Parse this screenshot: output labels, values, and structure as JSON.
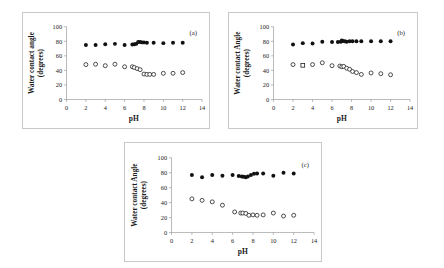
{
  "figure": {
    "background_color": "#ffffff",
    "panel_border_color": "#c9c9c9",
    "marker_filled_color": "#111111",
    "marker_open_color": "#ffffff"
  },
  "chart_data": [
    {
      "type": "scatter",
      "panel_label": "(a)",
      "title": "",
      "xlabel": "pH",
      "ylabel": "Water contact angle (degrees)",
      "ylabel_line1": "Water contact angle",
      "ylabel_line2": "(degrees)",
      "xlim": [
        0,
        14
      ],
      "ylim": [
        0,
        100
      ],
      "xticks": [
        0,
        2,
        4,
        6,
        8,
        10,
        12,
        14
      ],
      "yticks": [
        0,
        20,
        40,
        60,
        80,
        100
      ],
      "grid": false,
      "legend": "none",
      "series": [
        {
          "name": "filled-circles",
          "marker": "filled-circle",
          "x": [
            2.0,
            3.0,
            4.0,
            5.0,
            6.0,
            6.8,
            7.0,
            7.2,
            7.4,
            7.6,
            7.8,
            8.0,
            8.3,
            9.0,
            10.0,
            11.0,
            12.0
          ],
          "y": [
            75,
            75,
            76,
            76.5,
            75,
            75.5,
            76,
            76.5,
            79,
            79,
            78.5,
            78.5,
            78,
            78,
            77.5,
            78,
            78
          ]
        },
        {
          "name": "open-circles",
          "marker": "open-circle",
          "x": [
            2.0,
            3.0,
            4.0,
            5.0,
            6.0,
            6.8,
            7.0,
            7.3,
            7.6,
            8.0,
            8.3,
            8.6,
            9.0,
            10.0,
            11.0,
            12.0
          ],
          "y": [
            48,
            48.5,
            46.5,
            48.5,
            45,
            45,
            44,
            42.5,
            41,
            35,
            34.5,
            34.5,
            34.5,
            36,
            36,
            37
          ]
        }
      ]
    },
    {
      "type": "scatter",
      "panel_label": "(b)",
      "title": "",
      "xlabel": "pH",
      "ylabel": "Water contact Angle (degrees)",
      "ylabel_line1": "Water contact Angle",
      "ylabel_line2": "(degrees)",
      "xlim": [
        0,
        14
      ],
      "ylim": [
        0,
        100
      ],
      "xticks": [
        0,
        2,
        4,
        6,
        8,
        10,
        12,
        14
      ],
      "yticks": [
        0,
        20,
        40,
        60,
        80,
        100
      ],
      "grid": false,
      "legend": "none",
      "series": [
        {
          "name": "filled-circles",
          "marker": "filled-circle",
          "x": [
            2.0,
            3.0,
            4.0,
            5.0,
            6.0,
            6.6,
            6.9,
            7.0,
            7.1,
            7.3,
            7.5,
            7.8,
            8.1,
            8.5,
            9.0,
            10.0,
            11.0,
            12.0
          ],
          "y": [
            75.5,
            77.5,
            77,
            79.5,
            79,
            79,
            79.5,
            81,
            80.5,
            80,
            79.5,
            80,
            80,
            80,
            80,
            80,
            80,
            80
          ]
        },
        {
          "name": "open-circles",
          "marker": "open-circle",
          "x": [
            2.0,
            4.0,
            5.0,
            6.0,
            6.8,
            7.0,
            7.2,
            7.5,
            7.8,
            8.1,
            8.5,
            9.0,
            10.0,
            11.0,
            12.0
          ],
          "y": [
            48,
            48,
            50.5,
            46.5,
            46,
            45,
            45.5,
            43,
            41.5,
            38.5,
            37,
            34.5,
            36.5,
            35.5,
            34
          ]
        },
        {
          "name": "open-square",
          "marker": "open-square",
          "x": [
            3.0
          ],
          "y": [
            47
          ]
        }
      ]
    },
    {
      "type": "scatter",
      "panel_label": "(c)",
      "title": "",
      "xlabel": "pH",
      "ylabel": "Water contact Angle (degrees)",
      "ylabel_line1": "Water contact Angle",
      "ylabel_line2": "(degrees)",
      "xlim": [
        0,
        14
      ],
      "ylim": [
        0,
        100
      ],
      "xticks": [
        0,
        2,
        4,
        6,
        8,
        10,
        12,
        14
      ],
      "yticks": [
        0,
        20,
        40,
        60,
        80,
        100
      ],
      "grid": false,
      "legend": "none",
      "series": [
        {
          "name": "filled-circles",
          "marker": "filled-circle",
          "x": [
            2.0,
            3.0,
            4.0,
            5.0,
            6.0,
            6.6,
            6.9,
            7.1,
            7.3,
            7.5,
            7.8,
            8.1,
            8.4,
            9.0,
            10.0,
            11.0,
            12.0
          ],
          "y": [
            77,
            74,
            77,
            76,
            77,
            75.5,
            75,
            74.5,
            74,
            75,
            77,
            78.5,
            79,
            79,
            76,
            80,
            79
          ]
        },
        {
          "name": "open-circles",
          "marker": "open-circle",
          "x": [
            2.0,
            3.0,
            4.0,
            5.0,
            6.2,
            6.8,
            7.0,
            7.3,
            7.6,
            8.0,
            8.4,
            9.0,
            10.0,
            11.0,
            12.0
          ],
          "y": [
            45,
            43,
            41,
            36.5,
            27.5,
            26,
            26,
            25.5,
            23,
            23.5,
            23,
            23.5,
            26,
            22,
            23
          ]
        }
      ]
    }
  ]
}
